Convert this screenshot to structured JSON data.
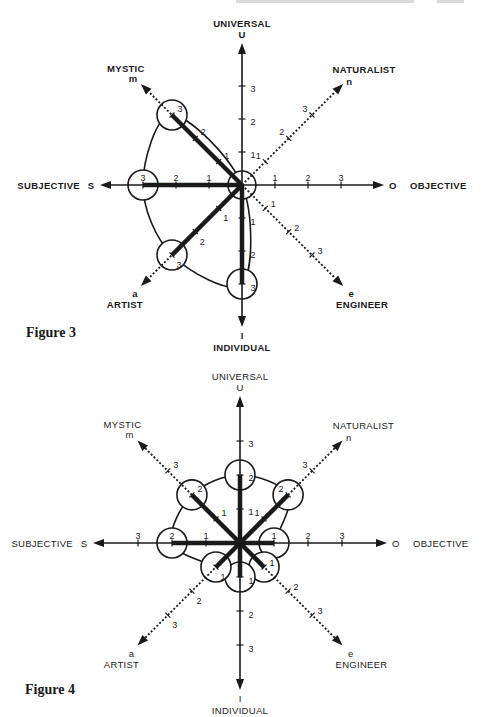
{
  "axes": [
    {
      "key": "U",
      "letter": "U",
      "label": "UNIVERSAL",
      "direction": "up",
      "line": "solid"
    },
    {
      "key": "n",
      "letter": "n",
      "label": "NATURALIST",
      "direction": "up-right",
      "line": "dotted"
    },
    {
      "key": "O",
      "letter": "O",
      "label": "OBJECTIVE",
      "direction": "right",
      "line": "solid"
    },
    {
      "key": "e",
      "letter": "e",
      "label": "ENGINEER",
      "direction": "down-right",
      "line": "dotted"
    },
    {
      "key": "I",
      "letter": "I",
      "label": "INDIVIDUAL",
      "direction": "down",
      "line": "solid"
    },
    {
      "key": "a",
      "letter": "a",
      "label": "ARTIST",
      "direction": "down-left",
      "line": "dotted"
    },
    {
      "key": "S",
      "letter": "S",
      "label": "SUBJECTIVE",
      "direction": "left",
      "line": "solid"
    },
    {
      "key": "m",
      "letter": "m",
      "label": "MYSTIC",
      "direction": "up-left",
      "line": "dotted"
    }
  ],
  "tick_labels": [
    "1",
    "2",
    "3"
  ],
  "figures": [
    {
      "caption": "Figure 3",
      "profile": {
        "U": 0,
        "n": 0,
        "O": 0,
        "e": 0,
        "I": 3,
        "a": 3,
        "S": 3,
        "m": 3
      }
    },
    {
      "caption": "Figure 4",
      "profile": {
        "U": 2,
        "n": 2,
        "O": 1,
        "e": 1,
        "I": 1,
        "a": 1,
        "S": 2,
        "m": 2
      }
    }
  ],
  "colors": {
    "ink": "#1a1a1a",
    "paper": "#ffffff"
  },
  "chart_data": [
    {
      "type": "radar",
      "title": "Figure 3",
      "categories": [
        "UNIVERSAL (U)",
        "NATURALIST (n)",
        "OBJECTIVE (O)",
        "ENGINEER (e)",
        "INDIVIDUAL (I)",
        "ARTIST (a)",
        "SUBJECTIVE (S)",
        "MYSTIC (m)"
      ],
      "values": [
        0,
        0,
        0,
        0,
        3,
        3,
        3,
        3
      ],
      "tick_labels": [
        "1",
        "2",
        "3"
      ],
      "rlim": [
        0,
        3
      ],
      "grid": false
    },
    {
      "type": "radar",
      "title": "Figure 4",
      "categories": [
        "UNIVERSAL (U)",
        "NATURALIST (n)",
        "OBJECTIVE (O)",
        "ENGINEER (e)",
        "INDIVIDUAL (I)",
        "ARTIST (a)",
        "SUBJECTIVE (S)",
        "MYSTIC (m)"
      ],
      "values": [
        2,
        2,
        1,
        1,
        1,
        1,
        2,
        2
      ],
      "tick_labels": [
        "1",
        "2",
        "3"
      ],
      "rlim": [
        0,
        3
      ],
      "grid": false
    }
  ]
}
